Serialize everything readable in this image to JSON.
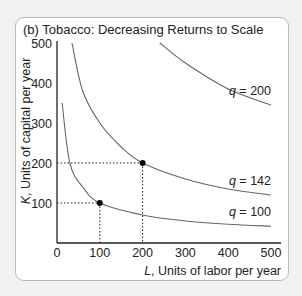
{
  "title": "(b) Tobacco: Decreasing Returns to Scale",
  "chart_data": {
    "type": "line",
    "title": "(b) Tobacco: Decreasing Returns to Scale",
    "xlabel": "L, Units of labor per year",
    "ylabel": "K, Units of capital per year",
    "xlim": [
      0,
      500
    ],
    "ylim": [
      0,
      500
    ],
    "x_ticks": [
      0,
      100,
      200,
      300,
      400,
      500
    ],
    "y_ticks": [
      100,
      200,
      300,
      400,
      500
    ],
    "grid": false,
    "series": [
      {
        "name": "q = 100",
        "label": "q = 100",
        "points": [
          [
            12,
            350
          ],
          [
            30,
            200
          ],
          [
            60,
            140
          ],
          [
            100,
            100
          ],
          [
            200,
            70
          ],
          [
            300,
            55
          ],
          [
            400,
            47
          ],
          [
            500,
            42
          ]
        ]
      },
      {
        "name": "q = 142",
        "label": "q = 142",
        "points": [
          [
            35,
            500
          ],
          [
            60,
            380
          ],
          [
            100,
            300
          ],
          [
            150,
            240
          ],
          [
            200,
            200
          ],
          [
            300,
            160
          ],
          [
            400,
            135
          ],
          [
            500,
            120
          ]
        ]
      },
      {
        "name": "q = 200",
        "label": "q = 200",
        "points": [
          [
            240,
            500
          ],
          [
            300,
            450
          ],
          [
            400,
            385
          ],
          [
            500,
            345
          ]
        ]
      }
    ],
    "highlighted_points": [
      {
        "L": 100,
        "K": 100,
        "on": "q = 100"
      },
      {
        "L": 200,
        "K": 200,
        "on": "q = 142"
      }
    ]
  }
}
